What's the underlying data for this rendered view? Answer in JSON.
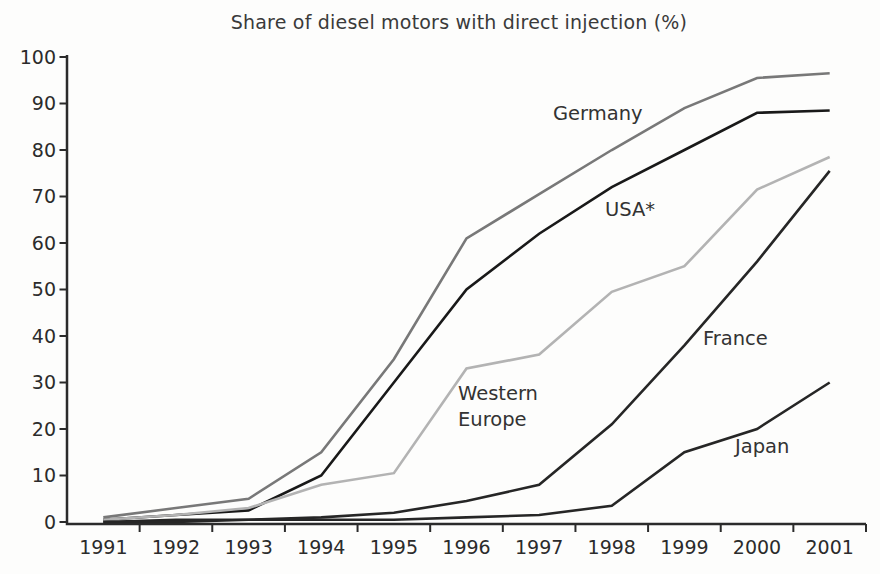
{
  "title": "Share of diesel motors with direct injection (%)",
  "chart_data": {
    "type": "line",
    "title": "Share of diesel motors with direct injection (%)",
    "xlabel": "",
    "ylabel": "",
    "x": [
      1991,
      1992,
      1993,
      1994,
      1995,
      1996,
      1997,
      1998,
      1999,
      2000,
      2001
    ],
    "ylim": [
      0,
      100
    ],
    "yticks": [
      0,
      10,
      20,
      30,
      40,
      50,
      60,
      70,
      80,
      90,
      100
    ],
    "grid": false,
    "legend": "inline-labels",
    "axis_color": "#2b2b2b",
    "tick_label_color": "#2b2b2b",
    "annotation_color": "#333333",
    "series": [
      {
        "name": "Germany",
        "color": "#787878",
        "values": [
          1,
          3,
          5,
          15,
          35,
          61,
          70.5,
          80,
          89,
          95.5,
          96.5
        ],
        "annotation": {
          "text": "Germany",
          "x": 553,
          "y": 120
        }
      },
      {
        "name": "USA*",
        "color": "#191919",
        "values": [
          0.5,
          1.5,
          2.5,
          10,
          30,
          50,
          62,
          72,
          80,
          88,
          88.5
        ],
        "annotation": {
          "text": "USA*",
          "x": 605,
          "y": 216
        }
      },
      {
        "name": "Western Europe",
        "color": "#b3b3b3",
        "values": [
          0.5,
          1.5,
          3,
          8,
          10.5,
          33,
          36,
          49.5,
          55,
          71.5,
          78.5
        ],
        "annotation": {
          "text": "Western\nEurope",
          "x": 458,
          "y": 400
        }
      },
      {
        "name": "France",
        "color": "#262626",
        "values": [
          0,
          0.5,
          0.5,
          1,
          2,
          4.5,
          8,
          21,
          38,
          56,
          75.5
        ],
        "annotation": {
          "text": "France",
          "x": 703,
          "y": 345
        }
      },
      {
        "name": "Japan",
        "color": "#262626",
        "values": [
          0,
          0,
          0.5,
          0.5,
          0.5,
          1,
          1.5,
          3.5,
          15,
          20,
          30
        ],
        "annotation": {
          "text": "Japan",
          "x": 735,
          "y": 453
        }
      }
    ]
  }
}
